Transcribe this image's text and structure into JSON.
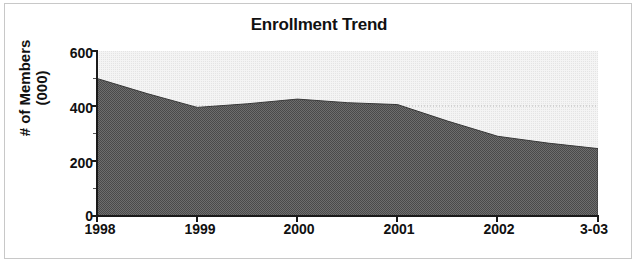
{
  "chart_data": {
    "type": "area",
    "title": "Enrollment Trend",
    "xlabel": "",
    "ylabel": "# of Members (000)",
    "ylabel_line1": "# of Members",
    "ylabel_line2": "(000)",
    "categories": [
      "1998",
      "1999",
      "2000",
      "2001",
      "2002",
      "3-03"
    ],
    "values": [
      500,
      395,
      425,
      405,
      290,
      245
    ],
    "series": [
      {
        "name": "Enrollment",
        "values": [
          500,
          395,
          425,
          405,
          290,
          245
        ]
      }
    ],
    "detailed_points": [
      {
        "x": "1998",
        "y": 500
      },
      {
        "x": "1998.5",
        "y": 445
      },
      {
        "x": "1999",
        "y": 395
      },
      {
        "x": "1999.5",
        "y": 408
      },
      {
        "x": "2000",
        "y": 425
      },
      {
        "x": "2000.5",
        "y": 412
      },
      {
        "x": "2001",
        "y": 405
      },
      {
        "x": "2001.5",
        "y": 345
      },
      {
        "x": "2002",
        "y": 290
      },
      {
        "x": "2002.5",
        "y": 265
      },
      {
        "x": "3-03",
        "y": 245
      }
    ],
    "ylim": [
      0,
      600
    ],
    "yticks": [
      0,
      200,
      400,
      600
    ],
    "ytick_labels": [
      "0",
      "200",
      "400",
      "600"
    ],
    "y_minor_ticks": [
      100,
      300,
      500
    ],
    "grid": true,
    "gridlines_dotted": true,
    "legend": "none",
    "area_fill_color": "#6b6b6b",
    "plot_background_color": "#f2f2f2",
    "axis_color": "#1a1a1a",
    "border_color": "#c8c8c8",
    "title_color": "#111111"
  }
}
